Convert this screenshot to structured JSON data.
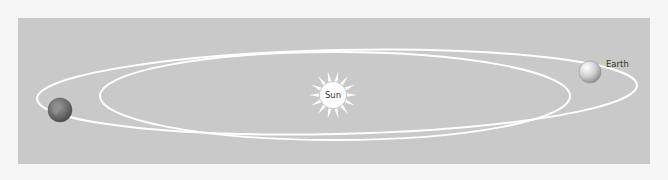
{
  "diagram": {
    "type": "orbit-illustration",
    "background_color": "#f6f6f6",
    "panel_color": "#c9c9c9",
    "orbit_color": "#ffffff",
    "sun": {
      "label": "Sun",
      "cx": 333,
      "cy": 95,
      "disc_radius": 13,
      "ray_outer_radius": 24,
      "color": "#ffffff"
    },
    "orbits": [
      {
        "name": "outer-orbit",
        "cx": 337,
        "cy": 92,
        "rx": 300,
        "ry": 42,
        "rotation_deg": 1.3
      },
      {
        "name": "inner-orbit",
        "cx": 335,
        "cy": 96,
        "rx": 235,
        "ry": 44,
        "rotation_deg": 0
      }
    ],
    "earth_positions": [
      {
        "name": "earth-left",
        "cx": 60,
        "cy": 110,
        "r": 12,
        "shaded": true,
        "label": ""
      },
      {
        "name": "earth-right",
        "cx": 590,
        "cy": 72,
        "r": 11,
        "shaded": false,
        "label": "Earth"
      }
    ]
  }
}
